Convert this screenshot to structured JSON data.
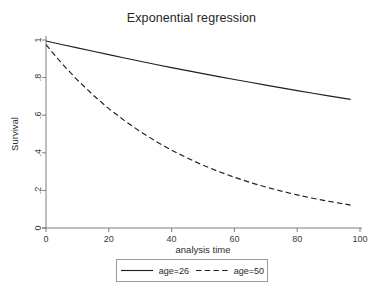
{
  "chart_data": {
    "type": "line",
    "title": "Exponential regression",
    "xlabel": "analysis time",
    "ylabel": "Survival",
    "xlim": [
      0,
      100
    ],
    "ylim": [
      0,
      1
    ],
    "grid": false,
    "legend_position": "bottom-outside",
    "xticks": [
      0,
      20,
      40,
      60,
      80,
      100
    ],
    "xticklabels": [
      "0",
      "20",
      "40",
      "60",
      "80",
      "100"
    ],
    "yticks": [
      0,
      0.2,
      0.4,
      0.6,
      0.8,
      1
    ],
    "yticklabels": [
      "0",
      ".2",
      ".4",
      ".6",
      ".8",
      "1"
    ],
    "x": [
      0,
      5,
      10,
      15,
      20,
      25,
      30,
      35,
      40,
      45,
      50,
      55,
      60,
      65,
      70,
      75,
      80,
      85,
      90,
      97
    ],
    "series": [
      {
        "name": "age=26",
        "style": "solid",
        "color": "#1f1f1f",
        "values": [
          0.995,
          0.976,
          0.958,
          0.94,
          0.922,
          0.904,
          0.887,
          0.87,
          0.853,
          0.837,
          0.821,
          0.805,
          0.79,
          0.775,
          0.76,
          0.745,
          0.731,
          0.717,
          0.703,
          0.684
        ]
      },
      {
        "name": "age=50",
        "style": "dashed",
        "color": "#1f1f1f",
        "values": [
          0.975,
          0.876,
          0.787,
          0.707,
          0.635,
          0.571,
          0.513,
          0.461,
          0.414,
          0.372,
          0.334,
          0.3,
          0.27,
          0.242,
          0.218,
          0.196,
          0.176,
          0.158,
          0.142,
          0.122
        ]
      }
    ]
  },
  "legend": {
    "entries": [
      {
        "label": "age=26",
        "style": "solid"
      },
      {
        "label": "age=50",
        "style": "dashed"
      }
    ]
  }
}
